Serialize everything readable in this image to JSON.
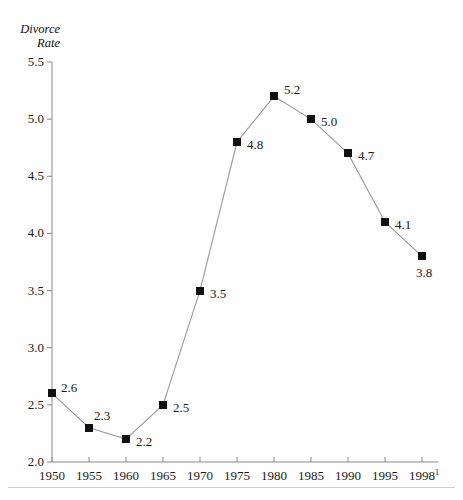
{
  "chart_data": {
    "type": "line",
    "title": "",
    "ylabel": "Divorce\nRate",
    "xlabel": "",
    "categories": [
      "1950",
      "1955",
      "1960",
      "1965",
      "1970",
      "1975",
      "1980",
      "1985",
      "1990",
      "1995",
      "1998"
    ],
    "x_tick_labels": [
      "1950",
      "1955",
      "1960",
      "1965",
      "1970",
      "1975",
      "1980",
      "1985",
      "1990",
      "1995",
      "1998"
    ],
    "x_last_footnote": "1",
    "values": [
      2.6,
      2.3,
      2.2,
      2.5,
      3.5,
      4.8,
      5.2,
      5.0,
      4.7,
      4.1,
      3.8
    ],
    "point_labels": [
      "2.6",
      "2.3",
      "2.2",
      "2.5",
      "3.5",
      "4.8",
      "5.2",
      "5.0",
      "4.7",
      "4.1",
      "3.8"
    ],
    "y_tick_labels": [
      "2.0",
      "2.5",
      "3.0",
      "3.5",
      "4.0",
      "4.5",
      "5.0",
      "5.5"
    ],
    "y_ticks": [
      2.0,
      2.5,
      3.0,
      3.5,
      4.0,
      4.5,
      5.0,
      5.5
    ],
    "ylim": [
      2.0,
      5.5
    ],
    "grid": false,
    "legend": "none",
    "marker": "filled-square",
    "colors": {
      "marker": "#111111",
      "line": "#9a9a9a",
      "axis": "#8a8a8a",
      "text": "#1a1a1a"
    },
    "label_offsets": [
      {
        "dx": 9,
        "dy": -13
      },
      {
        "dx": 5,
        "dy": -20
      },
      {
        "dx": 10,
        "dy": -5
      },
      {
        "dx": 10,
        "dy": -5
      },
      {
        "dx": 10,
        "dy": -5
      },
      {
        "dx": 10,
        "dy": -5
      },
      {
        "dx": 10,
        "dy": -14
      },
      {
        "dx": 10,
        "dy": -5
      },
      {
        "dx": 10,
        "dy": -5
      },
      {
        "dx": 10,
        "dy": -5
      },
      {
        "dx": -6,
        "dy": 9
      }
    ]
  }
}
